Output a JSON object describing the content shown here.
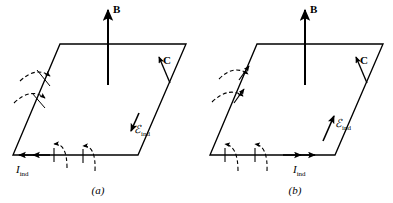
{
  "figure": {
    "type": "physics-diagram",
    "stroke_color": "#000000",
    "background_color": "#ffffff",
    "panels": [
      {
        "id": "a",
        "caption": "(a)",
        "field_label": "B",
        "contour_label": "C",
        "emf_label": "ℰ",
        "emf_subscript": "ind",
        "current_label": "I",
        "current_subscript": "ind",
        "emf_arrow_direction": "down-left",
        "current_arrow_direction": "left",
        "flux_arrow_direction": "into-loop",
        "field_arrow_direction": "up"
      },
      {
        "id": "b",
        "caption": "(b)",
        "field_label": "B",
        "contour_label": "C",
        "emf_label": "ℰ",
        "emf_subscript": "ind",
        "current_label": "I",
        "current_subscript": "ind",
        "emf_arrow_direction": "up-right",
        "current_arrow_direction": "right",
        "flux_arrow_direction": "out-of-loop",
        "field_arrow_direction": "up"
      }
    ]
  }
}
